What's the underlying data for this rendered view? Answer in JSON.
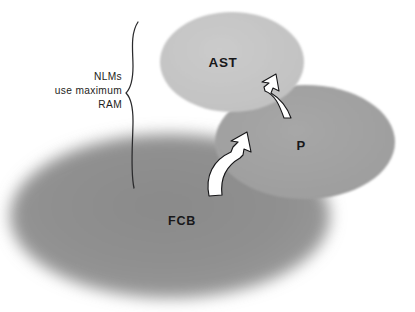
{
  "diagram": {
    "background_color": "#ffffff",
    "shapes": [
      {
        "id": "fcb",
        "label": "FCB",
        "role": "outer-region",
        "fill_color": "#8f8f8f",
        "edge_style": "blurred",
        "label_color": "#18181a"
      },
      {
        "id": "ast",
        "label": "AST",
        "role": "upper-region",
        "fill_color": "#c6c6c6",
        "edge_style": "sharp",
        "label_color": "#18181a"
      },
      {
        "id": "p",
        "label": "P",
        "role": "right-region",
        "fill_color": "#a3a3a3",
        "edge_style": "sharp",
        "label_color": "#18181a"
      }
    ],
    "arrows": [
      {
        "id": "arrow-fcb-to-p",
        "from": "FCB",
        "to": "P",
        "style": "curved-white-outlined",
        "fill_color": "#ffffff",
        "stroke_color": "#1a1a1a"
      },
      {
        "id": "arrow-p-to-ast",
        "from": "P",
        "to": "AST",
        "style": "curved-white-outlined",
        "fill_color": "#ffffff",
        "stroke_color": "#1a1a1a"
      }
    ],
    "annotation": {
      "id": "nlms-brace-note",
      "lines": [
        "NLMs",
        "use maximum",
        "RAM"
      ],
      "text_align": "right",
      "text_color": "#1d1d20",
      "brace": {
        "orientation": "left-pointing",
        "style": "hand-drawn",
        "stroke_color": "#2a2a2c"
      }
    }
  }
}
